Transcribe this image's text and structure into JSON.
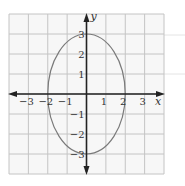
{
  "chart_data": {
    "type": "line",
    "title": "",
    "xlabel": "x",
    "ylabel": "y",
    "xlim": [
      -4,
      4
    ],
    "ylim": [
      -4,
      4
    ],
    "grid": true,
    "x_ticks": [
      -3,
      -2,
      -1,
      1,
      2,
      3
    ],
    "y_ticks": [
      -3,
      -2,
      -1,
      1,
      2,
      3
    ],
    "x_tick_labels": [
      "−3",
      "−2",
      "−1",
      "1",
      "2",
      "3"
    ],
    "y_tick_labels": [
      "−3",
      "−2",
      "−1",
      "1",
      "2",
      "3"
    ],
    "series": [
      {
        "name": "ellipse",
        "shape": "ellipse",
        "center": [
          0,
          0
        ],
        "semi_axis_x": 2,
        "semi_axis_y": 3,
        "intercepts": [
          [
            -2,
            0
          ],
          [
            2,
            0
          ],
          [
            0,
            3
          ],
          [
            0,
            -3
          ]
        ],
        "color": "#7a7a7a"
      }
    ]
  },
  "colors": {
    "grid": "#c4c4c4",
    "axes": "#222222",
    "curve": "#7a7a7a",
    "background": "#f7f7f7"
  }
}
